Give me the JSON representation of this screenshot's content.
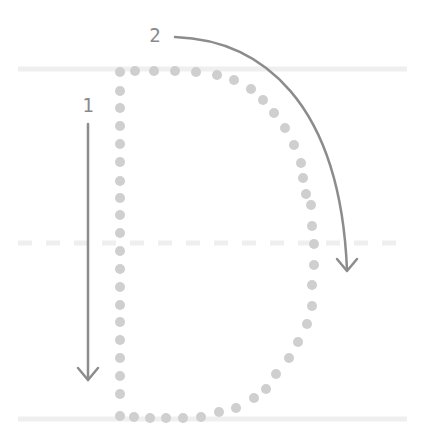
{
  "diagram": {
    "letter": "D",
    "colors": {
      "background": "#ffffff",
      "guide_line": "#efefef",
      "dot": "#cfcfcf",
      "arrow": "#8c8c8c",
      "label": "#8a8a8a"
    },
    "guides": {
      "top_y": 69,
      "middle_y": 243,
      "bottom_y": 419,
      "x_start": 18,
      "x_end": 407
    },
    "strokes": [
      {
        "number": "1",
        "label_x": 88,
        "label_y": 112,
        "direction": "down",
        "description": "Straight vertical line down"
      },
      {
        "number": "2",
        "label_x": 155,
        "label_y": 42,
        "direction": "curve-right-down",
        "description": "Curved line from top around to bottom"
      }
    ]
  }
}
